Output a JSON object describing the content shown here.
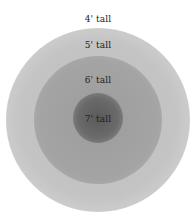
{
  "diagram": {
    "type": "concentric-circles",
    "rings": [
      {
        "label": "4' tall",
        "color": "#ffffff"
      },
      {
        "label": "5' tall",
        "color": "#c8c8c8"
      },
      {
        "label": "6' tall",
        "color": "#a4a4a4"
      },
      {
        "label": "7' tall",
        "color": "#6e6e6e"
      }
    ]
  }
}
